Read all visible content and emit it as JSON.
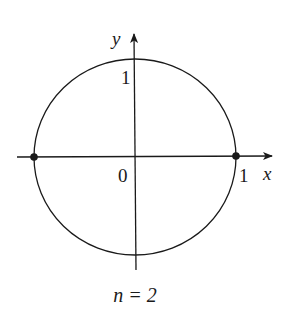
{
  "diagram": {
    "type": "unit-circle-plot",
    "caption": "n = 2",
    "axes": {
      "x_label": "x",
      "y_label": "y",
      "origin_label": "0",
      "x_tick_label": "1",
      "y_tick_label": "1"
    },
    "curve": {
      "shape": "circle",
      "center": [
        0,
        0
      ],
      "radius": 1
    },
    "points": [
      {
        "x": -1,
        "y": 0
      },
      {
        "x": 1,
        "y": 0
      }
    ],
    "colors": {
      "stroke": "#1a1a1a",
      "background": "#ffffff"
    }
  }
}
